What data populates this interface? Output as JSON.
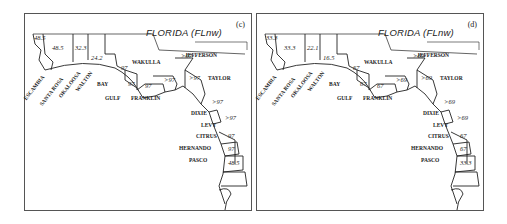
{
  "figure": {
    "panels": [
      {
        "id": "c",
        "tag": "(c)",
        "title": "FLORIDA (FLnw)",
        "counties": {
          "escambia": {
            "name": "ESCAMBIA",
            "value": "48.5"
          },
          "santa_rosa": {
            "name": "SANTA ROSA",
            "value": "48.5"
          },
          "okaloosa": {
            "name": "OKALOOSA",
            "value": "32.3"
          },
          "walton": {
            "name": "WALTON",
            "value": "24.2"
          },
          "bay": {
            "name": "BAY",
            "value": "97"
          },
          "gulf": {
            "name": "GULF",
            "value": "97"
          },
          "franklin": {
            "name": "FRANKLIN",
            "value": "97"
          },
          "wakulla": {
            "name": "WAKULLA",
            "value": ">97"
          },
          "jefferson": {
            "name": "JEFFERSON",
            "value": ">97"
          },
          "taylor": {
            "name": "TAYLOR",
            "value": ">97"
          },
          "dixie": {
            "name": "DIXIE",
            "value": ">97"
          },
          "levy": {
            "name": "LEVY",
            "value": ">97"
          },
          "citrus": {
            "name": "CITRUS",
            "value": "97"
          },
          "hernando": {
            "name": "HERNANDO",
            "value": "97"
          },
          "pasco": {
            "name": "PASCO",
            "value": "48.5"
          }
        }
      },
      {
        "id": "d",
        "tag": "(d)",
        "title": "FLORIDA (FLnw)",
        "counties": {
          "escambia": {
            "name": "ESCAMBIA",
            "value": "33.3"
          },
          "santa_rosa": {
            "name": "SANTA ROSA",
            "value": "33.3"
          },
          "okaloosa": {
            "name": "OKALOOSA",
            "value": "22.1"
          },
          "walton": {
            "name": "WALTON",
            "value": "16.5"
          },
          "bay": {
            "name": "BAY",
            "value": "67"
          },
          "gulf": {
            "name": "GULF",
            "value": "67"
          },
          "franklin": {
            "name": "FRANKLIN",
            "value": "67"
          },
          "wakulla": {
            "name": "WAKULLA",
            "value": ">69"
          },
          "jefferson": {
            "name": "JEFFERSON",
            "value": ">69"
          },
          "taylor": {
            "name": "TAYLOR",
            "value": ">69"
          },
          "dixie": {
            "name": "DIXIE",
            "value": ">69"
          },
          "levy": {
            "name": "LEVY",
            "value": ">69"
          },
          "citrus": {
            "name": "CITRUS",
            "value": "67"
          },
          "hernando": {
            "name": "HERNANDO",
            "value": "67"
          },
          "pasco": {
            "name": "PASCO",
            "value": "33.3"
          }
        }
      }
    ]
  }
}
